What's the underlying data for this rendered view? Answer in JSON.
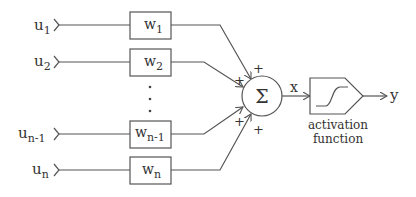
{
  "diagram": {
    "inputs": [
      {
        "label": "u",
        "sub": "1"
      },
      {
        "label": "u",
        "sub": "2"
      },
      {
        "label": "u",
        "sub": "n-1"
      },
      {
        "label": "u",
        "sub": "n"
      }
    ],
    "weights": [
      {
        "label": "w",
        "sub": "1"
      },
      {
        "label": "w",
        "sub": "2"
      },
      {
        "label": "w",
        "sub": "n-1"
      },
      {
        "label": "w",
        "sub": "n"
      }
    ],
    "signs": [
      "+",
      "+",
      "+",
      "+"
    ],
    "ellipsis": "⋮",
    "summation_symbol": "Σ",
    "sum_output_label": "x",
    "activation": {
      "line1": "activation",
      "line2": "function"
    },
    "output_label": "y"
  }
}
